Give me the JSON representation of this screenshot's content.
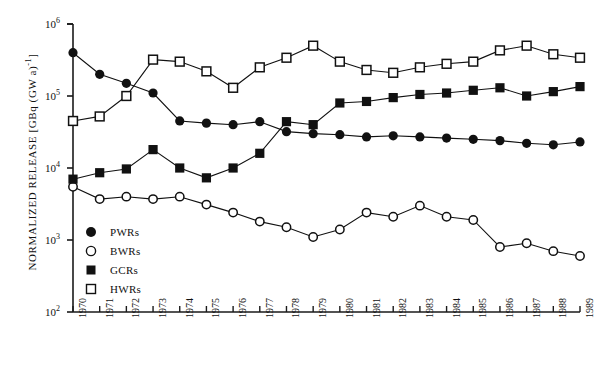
{
  "chart_data": {
    "type": "line",
    "title": "",
    "xlabel": "",
    "ylabel": "NORMALIZED RELEASE [GBq (GW a)-1]",
    "ylabel_parts": {
      "main": "NORMALIZED RELEASE [GBq (GW a)",
      "exp": "-1",
      "tail": "]"
    },
    "x_scale": "linear",
    "y_scale": "log",
    "ylim": [
      100,
      1000000
    ],
    "xlim": [
      1970,
      1989
    ],
    "grid": false,
    "legend_position": "inside-lower-left",
    "y_ticks": [
      {
        "value": 100,
        "label_base": "10",
        "label_exp": "2"
      },
      {
        "value": 1000,
        "label_base": "10",
        "label_exp": "3"
      },
      {
        "value": 10000,
        "label_base": "10",
        "label_exp": "4"
      },
      {
        "value": 100000,
        "label_base": "10",
        "label_exp": "5"
      },
      {
        "value": 1000000,
        "label_base": "10",
        "label_exp": "6"
      }
    ],
    "categories": [
      "1970",
      "1971",
      "1972",
      "1973",
      "1974",
      "1975",
      "1976",
      "1977",
      "1978",
      "1979",
      "1980",
      "1981",
      "1982",
      "1983",
      "1984",
      "1985",
      "1986",
      "1987",
      "1988",
      "1989"
    ],
    "series": [
      {
        "name": "PWRs",
        "marker": "filled-circle",
        "values": [
          400000,
          200000,
          150000,
          110000,
          45000,
          42000,
          40000,
          44000,
          32000,
          30000,
          29000,
          27000,
          28000,
          27000,
          26000,
          25000,
          24000,
          22000,
          21000,
          23000
        ]
      },
      {
        "name": "BWRs",
        "marker": "open-circle",
        "values": [
          5500,
          3700,
          4000,
          3700,
          4000,
          3100,
          2400,
          1800,
          1500,
          1100,
          1400,
          2400,
          2100,
          3000,
          2100,
          1900,
          800,
          900,
          700,
          600
        ]
      },
      {
        "name": "GCRs",
        "marker": "filled-square",
        "values": [
          7000,
          8600,
          9700,
          18000,
          10000,
          7300,
          10000,
          16000,
          44000,
          40000,
          80000,
          84000,
          95000,
          105000,
          110000,
          120000,
          130000,
          100000,
          115000,
          135000
        ]
      },
      {
        "name": "HWRs",
        "marker": "open-square",
        "values": [
          45000,
          52000,
          100000,
          320000,
          300000,
          220000,
          130000,
          250000,
          340000,
          500000,
          300000,
          230000,
          210000,
          250000,
          280000,
          300000,
          430000,
          500000,
          380000,
          340000
        ]
      }
    ]
  },
  "legend": {
    "items": [
      {
        "label": "PWRs",
        "marker": "filled-circle"
      },
      {
        "label": "BWRs",
        "marker": "open-circle"
      },
      {
        "label": "GCRs",
        "marker": "filled-square"
      },
      {
        "label": "HWRs",
        "marker": "open-square"
      }
    ]
  }
}
